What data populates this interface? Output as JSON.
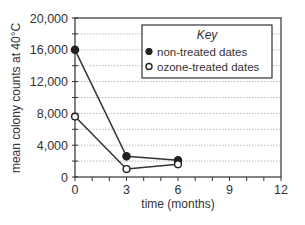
{
  "chart_data": {
    "type": "line",
    "title": "",
    "xlabel": "time (months)",
    "ylabel": "mean colony counts at 40°C",
    "xlim": [
      0,
      12
    ],
    "ylim": [
      0,
      20000
    ],
    "x_ticks": [
      0,
      3,
      6,
      9,
      12
    ],
    "x_tick_labels": [
      "0",
      "3",
      "6",
      "9",
      "12"
    ],
    "y_ticks": [
      0,
      4000,
      8000,
      12000,
      16000,
      20000
    ],
    "y_tick_labels": [
      "0",
      "4,000",
      "8,000",
      "12,000",
      "16,000",
      "20,000"
    ],
    "grid": {
      "horizontal_every": 2000,
      "style": "dotted"
    },
    "legend": {
      "title": "Key",
      "position": "upper right",
      "entries": [
        "non-treated dates",
        "ozone-treated dates"
      ]
    },
    "x": [
      0,
      3,
      6
    ],
    "series": [
      {
        "name": "non-treated dates",
        "marker": "filled-circle",
        "values": [
          16000,
          2600,
          2100
        ]
      },
      {
        "name": "ozone-treated dates",
        "marker": "open-circle",
        "values": [
          7600,
          1000,
          1600
        ]
      }
    ]
  }
}
